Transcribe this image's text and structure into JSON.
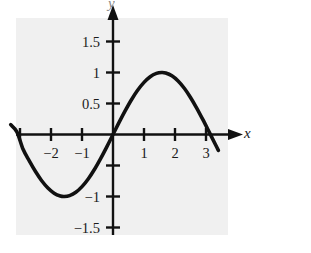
{
  "figure": {
    "title": "",
    "x_axis_label": "x",
    "y_axis_label": "y",
    "panel_color": "#f0f0f0",
    "ink_color": "#111111",
    "page_color": "#ffffff"
  },
  "chart_data": {
    "type": "line",
    "title": "",
    "xlabel": "x",
    "ylabel": "y",
    "grid": false,
    "legend": null,
    "xlim": [
      -3.45,
      3.55
    ],
    "ylim": [
      -1.75,
      1.75
    ],
    "xticks": [
      -2,
      -1,
      1,
      2,
      3
    ],
    "xtick_labels": [
      "−2",
      "−1",
      "1",
      "2",
      "3"
    ],
    "yticks": [
      1.5,
      1,
      0.5,
      -1,
      -1.5
    ],
    "ytick_labels": [
      "1.5",
      "1",
      "0.5",
      "−1",
      "−1.5"
    ],
    "function": "y = sin(x)",
    "series": [
      {
        "name": "sin(x)",
        "x": [
          -3.3,
          -3.1,
          -2.9,
          -2.7,
          -2.5,
          -2.3,
          -2.1,
          -1.9,
          -1.7,
          -1.57,
          -1.4,
          -1.2,
          -1.0,
          -0.8,
          -0.6,
          -0.4,
          -0.2,
          0.0,
          0.2,
          0.4,
          0.6,
          0.8,
          1.0,
          1.2,
          1.4,
          1.57,
          1.7,
          1.9,
          2.1,
          2.3,
          2.5,
          2.7,
          2.9,
          3.1,
          3.3,
          3.4
        ],
        "y": [
          0.158,
          0.042,
          -0.239,
          -0.427,
          -0.598,
          -0.746,
          -0.863,
          -0.946,
          -0.992,
          -1.0,
          -0.985,
          -0.932,
          -0.841,
          -0.717,
          -0.565,
          -0.389,
          -0.199,
          0.0,
          0.199,
          0.389,
          0.565,
          0.717,
          0.841,
          0.932,
          0.985,
          1.0,
          0.992,
          0.946,
          0.863,
          0.746,
          0.598,
          0.427,
          0.239,
          0.042,
          -0.158,
          -0.256
        ]
      }
    ],
    "annotations": [
      {
        "name": "minimum",
        "x": -1.57,
        "y": -1.0
      },
      {
        "name": "maximum",
        "x": 1.57,
        "y": 1.0
      },
      {
        "name": "zero-crossing-origin",
        "x": 0,
        "y": 0
      },
      {
        "name": "zero-crossing-left",
        "x": -3.14,
        "y": 0
      },
      {
        "name": "zero-crossing-right",
        "x": 3.14,
        "y": 0
      }
    ]
  }
}
